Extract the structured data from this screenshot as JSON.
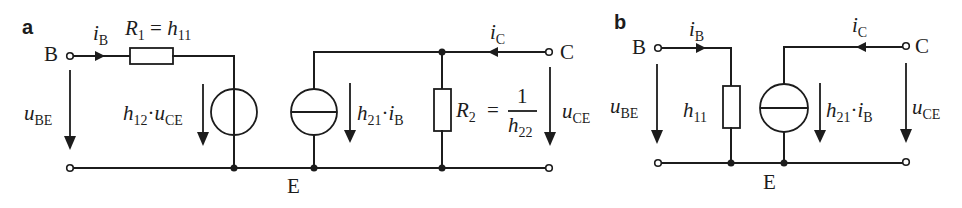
{
  "figure": {
    "panels": [
      {
        "id": "a",
        "label": "a",
        "title": "Full h-parameter equivalent circuit",
        "terminals": {
          "base": "B",
          "collector": "C",
          "emitter": "E"
        },
        "labels": {
          "i_b_sym": "i",
          "i_b_sub": "B",
          "r1_sym": "R",
          "r1_sub": "1",
          "r1_eq": " = ",
          "r1_h": "h",
          "r1_h_sub": "11",
          "u_be_sym": "u",
          "u_be_sub": "BE",
          "vsrc_h": "h",
          "vsrc_h_sub": "12",
          "vsrc_dot": "·",
          "vsrc_u": "u",
          "vsrc_u_sub": "CE",
          "isrc_h": "h",
          "isrc_h_sub": "21",
          "isrc_dot": "·",
          "isrc_i": "i",
          "isrc_i_sub": "B",
          "r2_sym": "R",
          "r2_sub": "2",
          "r2_eq": "=",
          "r2_num": "1",
          "r2_den_h": "h",
          "r2_den_sub": "22",
          "i_c_sym": "i",
          "i_c_sub": "C",
          "u_ce_sym": "u",
          "u_ce_sub": "CE"
        }
      },
      {
        "id": "b",
        "label": "b",
        "title": "Simplified h-parameter equivalent circuit",
        "terminals": {
          "base": "B",
          "collector": "C",
          "emitter": "E"
        },
        "labels": {
          "i_b_sym": "i",
          "i_b_sub": "B",
          "u_be_sym": "u",
          "u_be_sub": "BE",
          "h11_sym": "h",
          "h11_sub": "11",
          "isrc_h": "h",
          "isrc_h_sub": "21",
          "isrc_dot": "·",
          "isrc_i": "i",
          "isrc_i_sub": "B",
          "i_c_sym": "i",
          "i_c_sub": "C",
          "u_ce_sym": "u",
          "u_ce_sub": "CE"
        }
      }
    ],
    "colors": {
      "ink": "#1c1c1c",
      "background": "#ffffff"
    }
  }
}
